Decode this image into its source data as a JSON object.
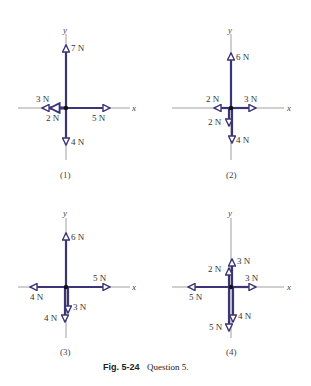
{
  "figure": {
    "caption_label": "Fig. 5-24",
    "caption_text": "Question 5.",
    "colors": {
      "vector": "#3b3577",
      "axis": "#777777",
      "origin": "#111111"
    }
  },
  "diagrams": [
    {
      "id": "1",
      "label": "(1)",
      "x_axis": "x",
      "y_axis": "y",
      "forces": [
        {
          "label": "7 N",
          "direction": "+y",
          "magnitude": 7
        },
        {
          "label": "3 N",
          "direction": "-x",
          "magnitude": 3
        },
        {
          "label": "2 N",
          "direction": "-x",
          "magnitude": 2
        },
        {
          "label": "5 N",
          "direction": "+x",
          "magnitude": 5
        },
        {
          "label": "4 N",
          "direction": "-y",
          "magnitude": 4
        }
      ]
    },
    {
      "id": "2",
      "label": "(2)",
      "x_axis": "x",
      "y_axis": "y",
      "forces": [
        {
          "label": "6 N",
          "direction": "+y",
          "magnitude": 6
        },
        {
          "label": "2 N",
          "direction": "-x",
          "magnitude": 2
        },
        {
          "label": "3 N",
          "direction": "+x",
          "magnitude": 3
        },
        {
          "label": "2 N",
          "direction": "-y",
          "magnitude": 2
        },
        {
          "label": "4 N",
          "direction": "-y",
          "magnitude": 4
        }
      ]
    },
    {
      "id": "3",
      "label": "(3)",
      "x_axis": "x",
      "y_axis": "y",
      "forces": [
        {
          "label": "6 N",
          "direction": "+y",
          "magnitude": 6
        },
        {
          "label": "5 N",
          "direction": "+x",
          "magnitude": 5
        },
        {
          "label": "4 N",
          "direction": "-x",
          "magnitude": 4
        },
        {
          "label": "3 N",
          "direction": "-y",
          "magnitude": 3
        },
        {
          "label": "4 N",
          "direction": "-y",
          "magnitude": 4
        }
      ]
    },
    {
      "id": "4",
      "label": "(4)",
      "x_axis": "x",
      "y_axis": "y",
      "forces": [
        {
          "label": "3 N",
          "direction": "+y",
          "magnitude": 3
        },
        {
          "label": "2 N",
          "direction": "+y",
          "magnitude": 2
        },
        {
          "label": "3 N",
          "direction": "+x",
          "magnitude": 3
        },
        {
          "label": "5 N",
          "direction": "-x",
          "magnitude": 5
        },
        {
          "label": "4 N",
          "direction": "-y",
          "magnitude": 4
        },
        {
          "label": "5 N",
          "direction": "-y",
          "magnitude": 5
        }
      ]
    }
  ]
}
